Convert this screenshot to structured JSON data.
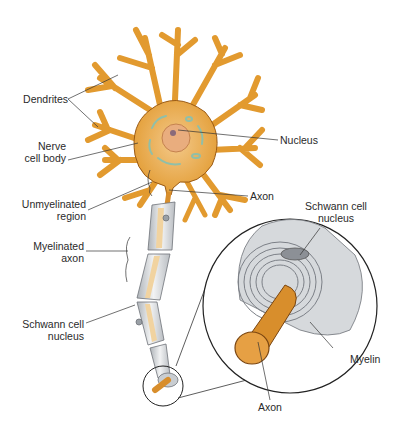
{
  "labels": {
    "dendrites": "Dendrites",
    "nerve_cell_body_1": "Nerve",
    "nerve_cell_body_2": "cell body",
    "nucleus": "Nucleus",
    "axon_top": "Axon",
    "unmyelinated_1": "Unmyelinated",
    "unmyelinated_2": "region",
    "myelinated_1": "Myelinated",
    "myelinated_2": "axon",
    "schwann_left_1": "Schwann cell",
    "schwann_left_2": "nucleus",
    "schwann_right_1": "Schwann cell",
    "schwann_right_2": "nucleus",
    "myelin": "Myelin",
    "axon_bottom": "Axon"
  },
  "colors": {
    "cell_body": "#e8a33a",
    "cell_outline": "#9a5a14",
    "nucleus": "#e6a87a",
    "organelle": "#9cc6b0",
    "myelin": "#d9dcdf",
    "myelin_ring": "#7c8087",
    "axon_core": "#f1d3a0",
    "leader_line": "#333333"
  }
}
